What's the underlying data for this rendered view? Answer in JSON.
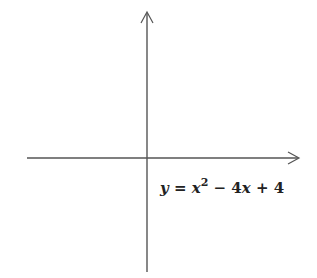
{
  "problem_label": "0)",
  "chart_data": {
    "type": "line",
    "title": "",
    "function": "y = x^2 - 4x + 4",
    "equation_label": "y = x² − 4x + 4",
    "xlabel": "x",
    "ylabel": "y",
    "xlim": [
      -6,
      6
    ],
    "ylim": [
      -6,
      6
    ],
    "grid": true,
    "vertex": [
      2,
      0
    ],
    "y_intercept": [
      0,
      4
    ],
    "x": [
      -0.4,
      0,
      0.5,
      1,
      1.5,
      2,
      2.5,
      3,
      3.5,
      4,
      4.4
    ],
    "y": [
      5.76,
      4,
      2.25,
      1,
      0.25,
      0,
      0.25,
      1,
      2.25,
      4,
      5.76
    ]
  }
}
